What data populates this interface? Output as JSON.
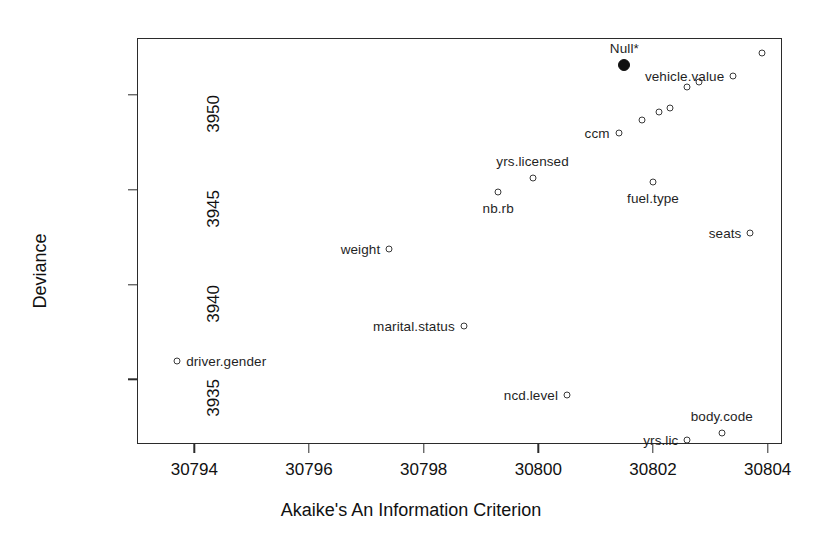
{
  "chart_data": {
    "type": "scatter",
    "title": "",
    "xlabel": "Akaike's An Information Criterion",
    "ylabel": "Deviance",
    "xlim": [
      30793.0,
      30804.25
    ],
    "ylim": [
      3931.6,
      3953.0
    ],
    "xticks": [
      30794,
      30796,
      30798,
      30800,
      30802,
      30804
    ],
    "yticks": [
      3935,
      3940,
      3945,
      3950
    ],
    "grid": false,
    "legend": "none",
    "points": [
      {
        "label": "Null*",
        "x": 30801.5,
        "y": 3951.6,
        "marker": "filled-circle",
        "label_pos": "above"
      },
      {
        "label": "vehicle.value",
        "x": 30803.4,
        "y": 3951.0,
        "marker": "open-circle",
        "label_pos": "left"
      },
      {
        "label": "",
        "x": 30803.9,
        "y": 3952.2,
        "marker": "open-circle",
        "label_pos": "none"
      },
      {
        "label": "",
        "x": 30802.6,
        "y": 3950.4,
        "marker": "open-circle",
        "label_pos": "none"
      },
      {
        "label": "",
        "x": 30802.8,
        "y": 3950.7,
        "marker": "open-circle",
        "label_pos": "none"
      },
      {
        "label": "",
        "x": 30802.3,
        "y": 3949.3,
        "marker": "open-circle",
        "label_pos": "none"
      },
      {
        "label": "",
        "x": 30802.1,
        "y": 3949.1,
        "marker": "open-circle",
        "label_pos": "none"
      },
      {
        "label": "",
        "x": 30801.8,
        "y": 3948.7,
        "marker": "open-circle",
        "label_pos": "none"
      },
      {
        "label": "ccm",
        "x": 30801.4,
        "y": 3948.0,
        "marker": "open-circle",
        "label_pos": "left"
      },
      {
        "label": "yrs.licensed",
        "x": 30799.9,
        "y": 3945.6,
        "marker": "open-circle",
        "label_pos": "above"
      },
      {
        "label": "nb.rb",
        "x": 30799.3,
        "y": 3944.9,
        "marker": "open-circle",
        "label_pos": "below"
      },
      {
        "label": "fuel.type",
        "x": 30802.0,
        "y": 3945.4,
        "marker": "open-circle",
        "label_pos": "below"
      },
      {
        "label": "seats",
        "x": 30803.7,
        "y": 3942.7,
        "marker": "open-circle",
        "label_pos": "left"
      },
      {
        "label": "weight",
        "x": 30797.4,
        "y": 3941.9,
        "marker": "open-circle",
        "label_pos": "left"
      },
      {
        "label": "marital.status",
        "x": 30798.7,
        "y": 3937.8,
        "marker": "open-circle",
        "label_pos": "left"
      },
      {
        "label": "driver.gender",
        "x": 30793.7,
        "y": 3936.0,
        "marker": "open-circle",
        "label_pos": "right"
      },
      {
        "label": "ncd.level",
        "x": 30800.5,
        "y": 3934.2,
        "marker": "open-circle",
        "label_pos": "left"
      },
      {
        "label": "body.code",
        "x": 30803.2,
        "y": 3932.2,
        "marker": "open-circle",
        "label_pos": "above"
      },
      {
        "label": "yrs.lic",
        "x": 30802.6,
        "y": 3931.8,
        "marker": "open-circle",
        "label_pos": "left"
      }
    ]
  },
  "axes": {
    "x_title": "Akaike's An Information Criterion",
    "y_title": "Deviance",
    "x_tick_labels": [
      "30794",
      "30796",
      "30798",
      "30800",
      "30802",
      "30804"
    ],
    "y_tick_labels": [
      "3935",
      "3940",
      "3945",
      "3950"
    ]
  },
  "colors": {
    "frame": "#2b2b2b",
    "marker_stroke": "#3a3a3a",
    "marker_fill": "#ffffff",
    "highlight_fill": "#111111",
    "text": "#1a1a1a",
    "background": "#ffffff"
  }
}
